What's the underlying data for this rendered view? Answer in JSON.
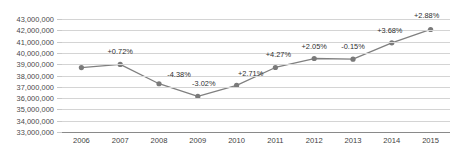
{
  "chart_data": {
    "type": "line",
    "title": "",
    "subtitle": "",
    "xlabel": "",
    "ylabel": "",
    "categories": [
      "2006",
      "2007",
      "2008",
      "2009",
      "2010",
      "2011",
      "2012",
      "2013",
      "2014",
      "2015"
    ],
    "values": [
      38700000,
      38979000,
      37271000,
      36145000,
      37124000,
      38709000,
      39503000,
      39444000,
      40895000,
      42073000
    ],
    "point_labels": [
      "",
      "+0.72%",
      "-4.38%",
      "-3.02%",
      "+2.71%",
      "+4.27%",
      "+2.05%",
      "-0.15%",
      "+3.68%",
      "+2.88%"
    ],
    "ylim": [
      33000000,
      43000000
    ],
    "ytick_labels": [
      "43,000,000",
      "42,000,000",
      "41,000,000",
      "40,000,000",
      "39,000,000",
      "38,000,000",
      "37,000,000",
      "36,000,000",
      "35,000,000",
      "34,000,000",
      "33,000,000"
    ],
    "ytick_values": [
      43000000,
      42000000,
      41000000,
      40000000,
      39000000,
      38000000,
      37000000,
      36000000,
      35000000,
      34000000,
      33000000
    ],
    "grid": true,
    "legend": "none",
    "series_color": "#808080",
    "marker_color": "#7a7a7a",
    "grid_color": "#d4d4d4",
    "axis_color": "#8a8a8a",
    "label_color": "#2e2e2e"
  }
}
